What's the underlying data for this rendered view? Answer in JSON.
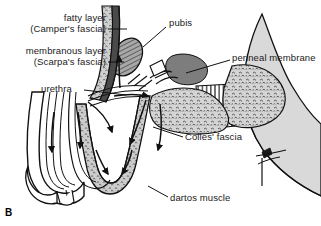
{
  "figure": {
    "panel_letter": "B",
    "type": "anatomical-illustration",
    "background_color": "#ffffff",
    "ink_color": "#1a1a1a",
    "labels": [
      {
        "id": "fatty-layer",
        "line1": "fatty layer",
        "line2": "(Camper's fascia)",
        "x": 10,
        "y": 12,
        "width": 96,
        "leader": {
          "x1": 108,
          "y1": 29,
          "x2": 127,
          "y2": 29
        }
      },
      {
        "id": "membranous-layer",
        "line1": "membranous layer",
        "line2": "(Scarpa's fascia)",
        "x": 4,
        "y": 45,
        "width": 102,
        "leader": {
          "x1": 108,
          "y1": 62,
          "x2": 124,
          "y2": 62
        }
      },
      {
        "id": "urethra",
        "line1": "urethra",
        "line2": "",
        "x": 41,
        "y": 83,
        "width": 40,
        "leader": {
          "x1": 84,
          "y1": 90,
          "x2": 126,
          "y2": 95
        }
      },
      {
        "id": "pubis",
        "line1": "pubis",
        "line2": "",
        "x": 169,
        "y": 17,
        "width": 31,
        "leader": {
          "x1": 166,
          "y1": 27,
          "x2": 143,
          "y2": 47
        }
      },
      {
        "id": "perineal-membrane",
        "line1": "perineal membrane",
        "line2": "",
        "x": 232,
        "y": 52,
        "width": 92,
        "leader": {
          "x1": 230,
          "y1": 60,
          "x2": 186,
          "y2": 73
        }
      },
      {
        "id": "colles-fascia",
        "line1": "Colles' fascia",
        "line2": "",
        "x": 185,
        "y": 131,
        "width": 64,
        "leader": {
          "x1": 183,
          "y1": 137,
          "x2": 153,
          "y2": 127
        }
      },
      {
        "id": "dartos-muscle",
        "line1": "dartos muscle",
        "line2": "",
        "x": 170,
        "y": 192,
        "width": 70,
        "leader": {
          "x1": 168,
          "y1": 197,
          "x2": 148,
          "y2": 186
        }
      }
    ],
    "colors": {
      "outline": "#111111",
      "fat_fill": "#c9c9c9",
      "fat_light": "#dcdcdc",
      "membrane_fill": "#b4b4b4",
      "tissue_fill": "#d2d2d2",
      "pubis_fill": "#9a9a9a",
      "white": "#ffffff"
    }
  }
}
